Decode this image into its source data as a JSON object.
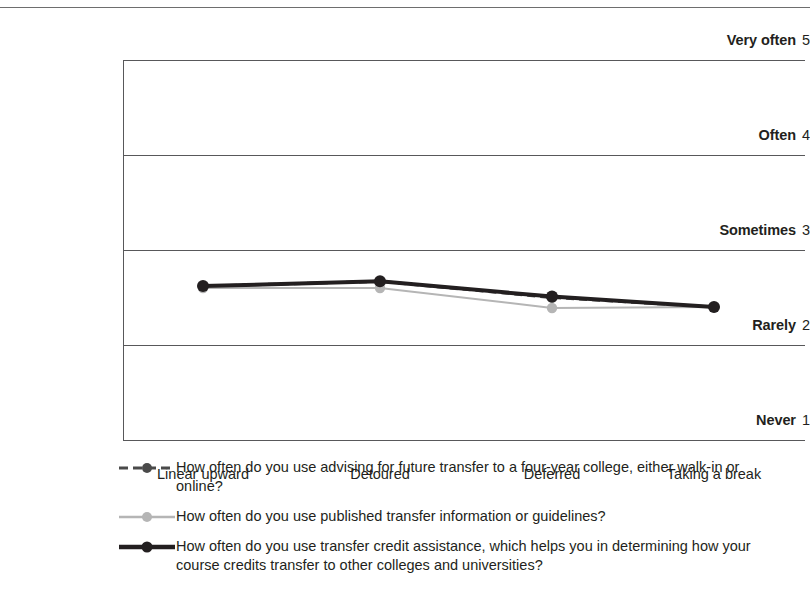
{
  "chart_data": {
    "type": "line",
    "title": "",
    "xlabel": "",
    "ylabel": "",
    "categories": [
      "Linear upward",
      "Detoured",
      "Deferred",
      "Taking a break"
    ],
    "ylim": [
      1,
      5
    ],
    "ytick_values": [
      5,
      4,
      3,
      2,
      1
    ],
    "ytick_labels": [
      "Very often",
      "Often",
      "Sometimes",
      "Rarely",
      "Never"
    ],
    "grid": "horizontal",
    "legend_position": "below",
    "series": [
      {
        "name": "How often do you use advising for future transfer to a four-year college, either walk-in or online?",
        "values": [
          2.62,
          2.67,
          2.5,
          2.4
        ],
        "color": "#4a4a4a",
        "style": "dashed",
        "width": 3,
        "marker": "circle"
      },
      {
        "name": "How often do you use published transfer information or guidelines?",
        "values": [
          2.6,
          2.6,
          2.39,
          2.4
        ],
        "color": "#b5b5b5",
        "style": "solid",
        "width": 2,
        "marker": "circle"
      },
      {
        "name": "How often do you use transfer credit assistance, which helps you in determining how your course credits transfer to other colleges and universities?",
        "values": [
          2.62,
          2.67,
          2.51,
          2.4
        ],
        "color": "#231f20",
        "style": "solid",
        "width": 4,
        "marker": "circle"
      }
    ]
  },
  "yaxis": {
    "ticks": [
      {
        "label": "Very often",
        "value": "5"
      },
      {
        "label": "Often",
        "value": "4"
      },
      {
        "label": "Sometimes",
        "value": "3"
      },
      {
        "label": "Rarely",
        "value": "2"
      },
      {
        "label": "Never",
        "value": "1"
      }
    ]
  },
  "xaxis": {
    "ticks": [
      {
        "label": "Linear upward"
      },
      {
        "label": "Detoured"
      },
      {
        "label": "Deferred"
      },
      {
        "label": "Taking a break"
      }
    ]
  },
  "legend": {
    "items": [
      {
        "label": "How often do you use advising for future transfer to a four-year college, either walk-in or online?"
      },
      {
        "label": "How often do you use published transfer information or guidelines?"
      },
      {
        "label": "How often do you use transfer credit assistance, which helps you in determining how your course credits transfer to other colleges and universities?"
      }
    ]
  }
}
